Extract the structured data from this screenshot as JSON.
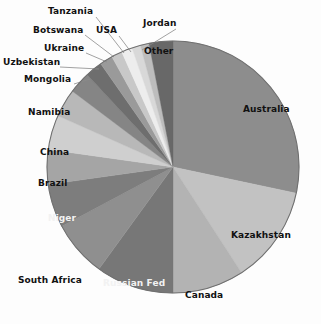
{
  "chart_data": {
    "type": "pie",
    "title": "",
    "subtitle": "",
    "xlabel": "",
    "ylabel": "",
    "legend_position": "none",
    "grid": false,
    "start_angle_deg": 0,
    "direction": "clockwise",
    "categories": [
      "Australia",
      "Kazakhstan",
      "Canada",
      "Russian Fed",
      "South Africa",
      "Niger",
      "Brazil",
      "China",
      "Namibia",
      "Mongolia",
      "Uzbekistan",
      "Ukraine",
      "Botswana",
      "USA",
      "Tanzania",
      "Jordan",
      "Other"
    ],
    "values": [
      28.3,
      12.5,
      9.2,
      10.0,
      7.2,
      5.6,
      4.4,
      4.4,
      3.6,
      2.8,
      2.2,
      1.7,
      1.4,
      1.4,
      1.1,
      1.1,
      3.1
    ],
    "units": "percent",
    "slices": [
      {
        "label": "Australia",
        "value": 28.3,
        "angle_deg": 102.0,
        "color": "#8d8d8d",
        "label_placement": "inside",
        "label_color": "#111111"
      },
      {
        "label": "Kazakhstan",
        "value": 12.5,
        "angle_deg": 45.0,
        "color": "#c2c2c2",
        "label_placement": "inside",
        "label_color": "#111111"
      },
      {
        "label": "Canada",
        "value": 9.2,
        "angle_deg": 33.0,
        "color": "#b3b3b3",
        "label_placement": "inside",
        "label_color": "#111111"
      },
      {
        "label": "Russian Fed",
        "value": 10.0,
        "angle_deg": 36.0,
        "color": "#777777",
        "label_placement": "inside",
        "label_color": "#f2f2f2"
      },
      {
        "label": "South Africa",
        "value": 7.2,
        "angle_deg": 26.0,
        "color": "#8f8f8f",
        "label_placement": "outside",
        "label_color": "#111111"
      },
      {
        "label": "Niger",
        "value": 5.6,
        "angle_deg": 20.0,
        "color": "#7d7d7d",
        "label_placement": "inside",
        "label_color": "#f2f2f2"
      },
      {
        "label": "Brazil",
        "value": 4.4,
        "angle_deg": 16.0,
        "color": "#a5a5a5",
        "label_placement": "outside",
        "label_color": "#111111"
      },
      {
        "label": "China",
        "value": 4.4,
        "angle_deg": 16.0,
        "color": "#cfcfcf",
        "label_placement": "outside",
        "label_color": "#111111"
      },
      {
        "label": "Namibia",
        "value": 3.6,
        "angle_deg": 13.0,
        "color": "#b8b8b8",
        "label_placement": "outside",
        "label_color": "#111111"
      },
      {
        "label": "Mongolia",
        "value": 2.8,
        "angle_deg": 10.0,
        "color": "#858585",
        "label_placement": "outside",
        "label_color": "#111111"
      },
      {
        "label": "Uzbekistan",
        "value": 2.2,
        "angle_deg": 8.0,
        "color": "#6e6e6e",
        "label_placement": "outside",
        "label_color": "#111111"
      },
      {
        "label": "Ukraine",
        "value": 1.7,
        "angle_deg": 6.0,
        "color": "#9a9a9a",
        "label_placement": "outside",
        "label_color": "#111111"
      },
      {
        "label": "Botswana",
        "value": 1.4,
        "angle_deg": 5.0,
        "color": "#c8c8c8",
        "label_placement": "outside",
        "label_color": "#111111"
      },
      {
        "label": "USA",
        "value": 1.4,
        "angle_deg": 5.0,
        "color": "#ededed",
        "label_placement": "outside",
        "label_color": "#111111"
      },
      {
        "label": "Tanzania",
        "value": 1.1,
        "angle_deg": 4.0,
        "color": "#d8d8d8",
        "label_placement": "outside",
        "label_color": "#111111"
      },
      {
        "label": "Jordan",
        "value": 1.1,
        "angle_deg": 4.0,
        "color": "#bdbdbd",
        "label_placement": "outside",
        "label_color": "#111111"
      },
      {
        "label": "Other",
        "value": 3.1,
        "angle_deg": 11.0,
        "color": "#686868",
        "label_placement": "inside",
        "label_color": "#111111"
      }
    ]
  },
  "geometry": {
    "center_x": 173,
    "center_y": 167,
    "radius": 126,
    "outline_color": "#6f6f6f"
  },
  "labels": [
    {
      "name": "slice-label-tanzania",
      "text": "Tanzania",
      "x": 48,
      "y": 6,
      "leader": [
        [
          96,
          17
        ],
        [
          124,
          53
        ]
      ]
    },
    {
      "name": "slice-label-jordan",
      "text": "Jordan",
      "x": 143,
      "y": 18,
      "leader": [
        [
          176,
          29
        ],
        [
          142,
          50
        ]
      ]
    },
    {
      "name": "slice-label-botswana",
      "text": "Botswana",
      "x": 33,
      "y": 25,
      "leader": [
        [
          85,
          35
        ],
        [
          114,
          57
        ]
      ]
    },
    {
      "name": "slice-label-usa",
      "text": "USA",
      "x": 96,
      "y": 25,
      "leader": [
        [
          119,
          36
        ],
        [
          131,
          52
        ]
      ]
    },
    {
      "name": "slice-label-ukraine",
      "text": "Ukraine",
      "x": 44,
      "y": 43,
      "leader": [
        [
          86,
          53
        ],
        [
          107,
          62
        ]
      ]
    },
    {
      "name": "slice-label-uzbekistan",
      "text": "Uzbekistan",
      "x": 3,
      "y": 57,
      "leader": [
        [
          60,
          67
        ],
        [
          99,
          69
        ]
      ]
    },
    {
      "name": "slice-label-mongolia",
      "text": "Mongolia",
      "x": 24,
      "y": 74,
      "leader": [
        [
          74,
          84
        ],
        [
          90,
          79
        ]
      ]
    },
    {
      "name": "slice-label-namibia",
      "text": "Namibia",
      "x": 28,
      "y": 107,
      "leader": null
    },
    {
      "name": "slice-label-china",
      "text": "China",
      "x": 40,
      "y": 147,
      "leader": null
    },
    {
      "name": "slice-label-brazil",
      "text": "Brazil",
      "x": 38,
      "y": 178,
      "leader": null
    },
    {
      "name": "slice-label-niger",
      "text": "Niger",
      "x": 48,
      "y": 213,
      "leader": null
    },
    {
      "name": "slice-label-south-africa",
      "text": "South Africa",
      "x": 18,
      "y": 275,
      "leader": null
    },
    {
      "name": "slice-label-russian-fed",
      "text": "Russian Fed",
      "x": 103,
      "y": 278,
      "leader": null
    },
    {
      "name": "slice-label-canada",
      "text": "Canada",
      "x": 185,
      "y": 290,
      "leader": null
    },
    {
      "name": "slice-label-kazakhstan",
      "text": "Kazakhstan",
      "x": 231,
      "y": 230,
      "leader": null
    },
    {
      "name": "slice-label-australia",
      "text": "Australia",
      "x": 243,
      "y": 104,
      "leader": null
    },
    {
      "name": "slice-label-other",
      "text": "Other",
      "x": 144,
      "y": 46,
      "leader": null
    }
  ]
}
